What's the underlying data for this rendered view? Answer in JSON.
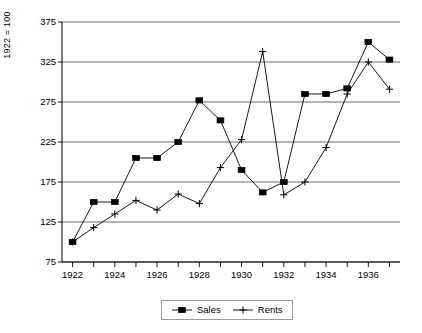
{
  "chart_data": {
    "type": "line",
    "title": "",
    "subtitle": "",
    "xlabel": "",
    "ylabel": "1922 = 100",
    "x": [
      1922,
      1923,
      1924,
      1925,
      1926,
      1927,
      1928,
      1929,
      1930,
      1931,
      1932,
      1933,
      1934,
      1935,
      1936,
      1937
    ],
    "xlim": [
      1921.5,
      1937.5
    ],
    "ylim": [
      75,
      375
    ],
    "yticks": [
      75,
      125,
      175,
      225,
      275,
      325,
      375
    ],
    "xticks": [
      1922,
      1924,
      1926,
      1928,
      1930,
      1932,
      1934,
      1936
    ],
    "xtick_labels": [
      "1922",
      "1924",
      "1926",
      "1928",
      "1930",
      "1932",
      "1934",
      "1936"
    ],
    "ytick_labels": [
      "75",
      "125",
      "175",
      "225",
      "275",
      "325",
      "375"
    ],
    "minor_xticks": [
      1923,
      1925,
      1927,
      1929,
      1931,
      1933,
      1935,
      1937
    ],
    "grid": "horizontal",
    "legend_position": "bottom-center",
    "series": [
      {
        "name": "Sales",
        "marker": "filled-square",
        "color": "#000000",
        "values": [
          100,
          150,
          150,
          205,
          205,
          225,
          277,
          252,
          190,
          162,
          175,
          285,
          285,
          292,
          350,
          328
        ]
      },
      {
        "name": "Rents",
        "marker": "plus",
        "color": "#000000",
        "values": [
          100,
          118,
          135,
          152,
          140,
          160,
          148,
          193,
          228,
          338,
          159,
          175,
          218,
          285,
          325,
          291
        ]
      }
    ]
  },
  "legend": {
    "entries": [
      {
        "label": "Sales",
        "marker": "filled-square"
      },
      {
        "label": "Rents",
        "marker": "plus"
      }
    ]
  }
}
